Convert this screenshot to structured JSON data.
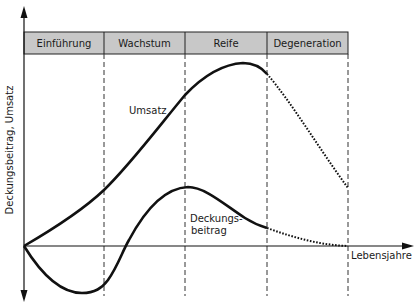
{
  "diagram": {
    "y_axis_label": "Deckungsbeitrag, Umsatz",
    "x_axis_label": "Lebensjahre",
    "phases": [
      {
        "label": "Einführung"
      },
      {
        "label": "Wachstum"
      },
      {
        "label": "Reife"
      },
      {
        "label": "Degeneration"
      }
    ],
    "curves": {
      "umsatz": {
        "label": "Umsatz"
      },
      "deckungsbeitrag": {
        "label_line1": "Deckungs-",
        "label_line2": "beitrag"
      }
    },
    "colors": {
      "header_fill": "#c8c8c8",
      "line": "#111111",
      "background": "#ffffff"
    }
  }
}
